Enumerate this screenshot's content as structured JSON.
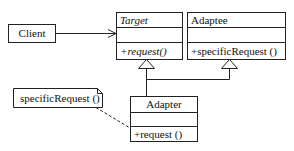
{
  "diagram": {
    "type": "UML class diagram (Adapter pattern)",
    "colors": {
      "stroke": "#222222",
      "background": "#ffffff",
      "text": "#111111"
    },
    "classes": {
      "client": {
        "name": "Client"
      },
      "target": {
        "name": "Target",
        "attributes": "",
        "operations": "+request()",
        "abstract": true
      },
      "adaptee": {
        "name": "Adaptee",
        "attributes": "",
        "operations": "+specificRequest ()"
      },
      "adapter": {
        "name": "Adapter",
        "attributes": "",
        "operations": "+request ()"
      }
    },
    "note": {
      "text": "specificRequest ()"
    },
    "relationships": [
      {
        "from": "Client",
        "to": "Target",
        "type": "association"
      },
      {
        "from": "Adapter",
        "to": "Target",
        "type": "generalization"
      },
      {
        "from": "Adapter",
        "to": "Adaptee",
        "type": "generalization"
      },
      {
        "from": "note",
        "to": "Adapter",
        "type": "note-anchor"
      }
    ]
  }
}
